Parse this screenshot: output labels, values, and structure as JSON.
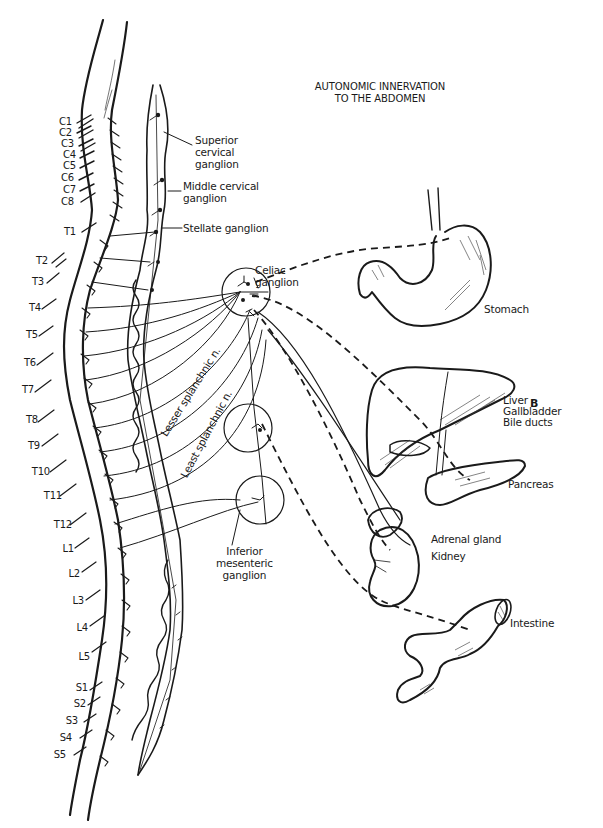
{
  "title": {
    "line1": "AUTONOMIC INNERVATION",
    "line2": "TO THE ABDOMEN"
  },
  "panel_letter": "B",
  "spinal_segments": {
    "cervical": [
      "C1",
      "C2",
      "C3",
      "C4",
      "C5",
      "C6",
      "C7",
      "C8"
    ],
    "thoracic": [
      "T1",
      "T2",
      "T3",
      "T4",
      "T5",
      "T6",
      "T7",
      "T8",
      "T9",
      "T10",
      "T11",
      "T12"
    ],
    "lumbar": [
      "L1",
      "L2",
      "L3",
      "L4",
      "L5"
    ],
    "sacral": [
      "S1",
      "S2",
      "S3",
      "S4",
      "S5"
    ]
  },
  "ganglia": {
    "superior_cervical": {
      "line1": "Superior",
      "line2": "cervical",
      "line3": "ganglion"
    },
    "middle_cervical": {
      "line1": "Middle cervical",
      "line2": "ganglion"
    },
    "stellate": "Stellate ganglion",
    "celiac": {
      "line1": "Celiac",
      "line2": "ganglion"
    },
    "inferior_mesenteric": {
      "line1": "Inferior",
      "line2": "mesenteric",
      "line3": "ganglion"
    }
  },
  "nerves": {
    "lesser_splanchnic": "Lesser splanchnic n.",
    "least_splanchnic": "Least splanchnic n."
  },
  "organs": {
    "stomach": "Stomach",
    "liver": "Liver",
    "gallbladder": "Gallbladder",
    "bile_ducts": "Bile ducts",
    "pancreas": "Pancreas",
    "adrenal_gland": "Adrenal gland",
    "kidney": "Kidney",
    "intestine": "Intestine"
  }
}
